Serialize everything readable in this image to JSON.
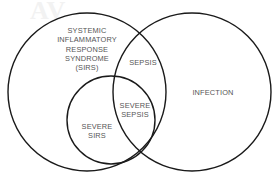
{
  "diagram": {
    "type": "venn",
    "background_color": "#ffffff",
    "stroke_color": "#1a1a1a",
    "text_color": "#555555",
    "watermark": "AV",
    "sets": [
      {
        "id": "sirs",
        "label": "SYSTEMIC\nINFLAMMATORY\nRESPONSE\nSYNDROME\n(SIRS)",
        "cx": 87,
        "cy": 92,
        "r": 79
      },
      {
        "id": "infection",
        "label": "INFECTION",
        "cx": 192,
        "cy": 92,
        "r": 79
      },
      {
        "id": "severe-sirs",
        "label": "SEVERE\nSIRS",
        "cx": 111,
        "cy": 120,
        "r": 44
      }
    ],
    "regions": [
      {
        "id": "sirs-only",
        "label": "SYSTEMIC\nINFLAMMATORY\nRESPONSE\nSYNDROME\n(SIRS)"
      },
      {
        "id": "sepsis",
        "label": "SEPSIS"
      },
      {
        "id": "severe-sepsis",
        "label": "SEVERE\nSEPSIS"
      },
      {
        "id": "severe-sirs",
        "label": "SEVERE\nSIRS"
      },
      {
        "id": "infection-only",
        "label": "INFECTION"
      }
    ]
  }
}
